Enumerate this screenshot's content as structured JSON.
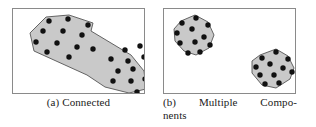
{
  "figure": {
    "background_color": "#ffffff",
    "border_color": "#8a8a8a",
    "region_fill_color": "#c9c9c9",
    "region_stroke_color": "#555555",
    "point_color": "#111111",
    "panels": [
      {
        "id": "a",
        "label": "(a)",
        "caption_full": "(a) Connected",
        "caption_words": [
          "(a)",
          "Connected"
        ],
        "box": {
          "x": 12,
          "y": 8,
          "width": 133,
          "height": 86
        },
        "component_count": 1,
        "point_count": 24,
        "components": [
          {
            "name": "single-connected-region",
            "hull": "33,8 56,6 80,14 78,22 118,46 131,62 133,80 116,84 92,78 74,66 21,42 17,24",
            "points": [
              [
                36,
                12
              ],
              [
                55,
                10
              ],
              [
                75,
                16
              ],
              [
                30,
                22
              ],
              [
                50,
                22
              ],
              [
                69,
                26
              ],
              [
                23,
                33
              ],
              [
                44,
                34
              ],
              [
                64,
                38
              ],
              [
                34,
                43
              ],
              [
                56,
                48
              ],
              [
                80,
                40
              ],
              [
                112,
                41
              ],
              [
                127,
                37
              ],
              [
                98,
                50
              ],
              [
                115,
                52
              ],
              [
                131,
                48
              ],
              [
                105,
                62
              ],
              [
                120,
                60
              ],
              [
                136,
                58
              ],
              [
                100,
                72
              ],
              [
                118,
                72
              ],
              [
                132,
                70
              ],
              [
                124,
                83
              ]
            ]
          }
        ]
      },
      {
        "id": "b",
        "label": "(b)",
        "caption_full": "(b) Multiple Components",
        "caption_line_1_words": [
          "(b)",
          "Multiple",
          "Compo-"
        ],
        "caption_line_2": "nents",
        "box": {
          "x": 163,
          "y": 8,
          "width": 133,
          "height": 86
        },
        "component_count": 2,
        "point_count": 22,
        "components": [
          {
            "name": "upper-left-cluster",
            "hull": "17,12 31,6 44,13 50,26 45,39 32,46 20,42 11,32 10,20",
            "points": [
              [
                18,
                14
              ],
              [
                32,
                9
              ],
              [
                44,
                16
              ],
              [
                13,
                24
              ],
              [
                28,
                20
              ],
              [
                40,
                28
              ],
              [
                16,
                34
              ],
              [
                31,
                33
              ],
              [
                46,
                36
              ],
              [
                24,
                44
              ],
              [
                36,
                43
              ]
            ]
          },
          {
            "name": "lower-right-cluster",
            "hull": "96,46 112,40 124,47 130,59 126,70 112,79 98,76 88,64 88,52",
            "points": [
              [
                98,
                49
              ],
              [
                112,
                43
              ],
              [
                124,
                50
              ],
              [
                92,
                58
              ],
              [
                106,
                55
              ],
              [
                119,
                59
              ],
              [
                96,
                66
              ],
              [
                110,
                66
              ],
              [
                128,
                63
              ],
              [
                101,
                75
              ],
              [
                115,
                74
              ]
            ]
          }
        ]
      }
    ]
  }
}
